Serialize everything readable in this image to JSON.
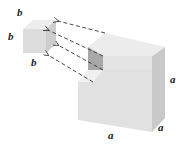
{
  "diagram": {
    "small_cube": {
      "labels": [
        "b",
        "b",
        "b"
      ]
    },
    "large_cube": {
      "labels": [
        "a",
        "a",
        "a"
      ]
    },
    "arrows": {
      "count": 4,
      "style": "dashed",
      "direction": "from notch in large cube to small cube"
    },
    "colors": {
      "face_top": "#ececec",
      "face_front": "#e0e0e0",
      "face_side": "#cfcfcf",
      "notch_dark": "#a9a9a9",
      "arrow": "#333333"
    }
  }
}
